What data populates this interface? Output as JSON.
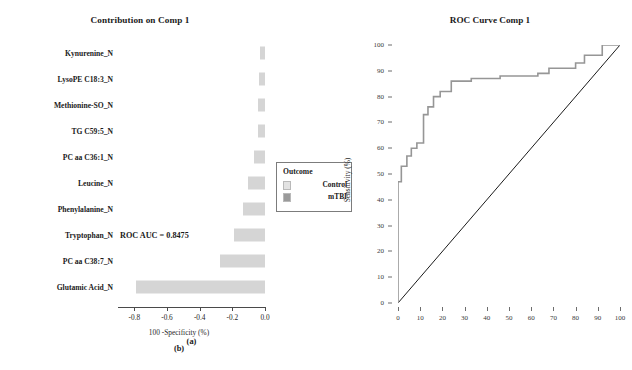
{
  "figure": {
    "width": 632,
    "height": 370,
    "background": "#ffffff"
  },
  "panel_a": {
    "caption": "(a)",
    "title": "Contribution on Comp 1",
    "bar_color": "#d5d5d5",
    "axis_color": "#4a4a4a"
  },
  "panel_b": {
    "caption": "(b)",
    "title": "ROC Curve Comp 1",
    "auc_label": "ROC AUC = 0.8475",
    "curve_color": "#969696",
    "diagonal_color": "#1a1a1a"
  },
  "legend": {
    "title": "Outcome",
    "items": [
      {
        "label": "Control",
        "color": "#e2e2e2"
      },
      {
        "label": "mTBI",
        "color": "#9a9a9a"
      }
    ]
  },
  "chart_data": [
    {
      "type": "bar",
      "orientation": "horizontal",
      "title": "Contribution on Comp 1",
      "xlabel": "",
      "ylabel": "",
      "xlim": [
        -0.9,
        0.0
      ],
      "xticks": [
        -0.8,
        -0.6,
        -0.4,
        -0.2,
        0.0
      ],
      "xticklabels": [
        "-0.8",
        "-0.6",
        "-0.4",
        "-0.2",
        "0.0"
      ],
      "grid": false,
      "group": "mTBI",
      "categories": [
        "Kynurenine_N",
        "LysoPE C18:3_N",
        "Methionine-SO_N",
        "TG C59:5_N",
        "PC aa C36:1_N",
        "Leucine_N",
        "Phenylalanine_N",
        "Tryptophan_N",
        "PC aa C38:7_N",
        "Glutamic Acid_N"
      ],
      "values": [
        -0.03,
        -0.035,
        -0.04,
        -0.04,
        -0.065,
        -0.105,
        -0.135,
        -0.19,
        -0.275,
        -0.79
      ]
    },
    {
      "type": "line",
      "subtype": "roc-step",
      "title": "ROC Curve Comp 1",
      "xlabel": "100 -Specificity (%)",
      "ylabel": "Sensitivity (%)",
      "xlim": [
        0,
        100
      ],
      "ylim": [
        0,
        100
      ],
      "xticks": [
        0,
        10,
        20,
        30,
        40,
        50,
        60,
        70,
        80,
        90,
        100
      ],
      "yticks": [
        0,
        10,
        20,
        30,
        40,
        50,
        60,
        70,
        80,
        90,
        100
      ],
      "grid": false,
      "auc": 0.8475,
      "legend_position": "none",
      "annotations": [
        "ROC AUC = 0.8475"
      ],
      "series": [
        {
          "name": "ROC curve",
          "x": [
            0,
            0,
            1.5,
            1.5,
            4,
            4,
            6,
            6,
            8.5,
            8.5,
            11.5,
            11.5,
            13.5,
            13.5,
            16,
            16,
            19,
            19,
            24,
            24,
            33,
            33,
            46,
            46,
            63,
            63,
            68,
            68,
            80,
            80,
            84,
            84,
            92,
            92,
            100
          ],
          "y": [
            0,
            47,
            47,
            53,
            53,
            57,
            57,
            60,
            60,
            62,
            62,
            73,
            73,
            76,
            76,
            80,
            80,
            82,
            82,
            86,
            86,
            87,
            87,
            88,
            88,
            89,
            89,
            91,
            91,
            93,
            93,
            96,
            96,
            100,
            100
          ]
        },
        {
          "name": "chance diagonal",
          "x": [
            0,
            100
          ],
          "y": [
            0,
            100
          ]
        }
      ]
    }
  ]
}
